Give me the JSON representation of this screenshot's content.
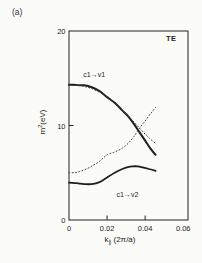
{
  "figure": {
    "panel_label": "(a)",
    "mode_label": "TE",
    "background": "#fbfbf8",
    "ink": "#222222",
    "curve_color": "#1f1f1f",
    "dotted_color": "#3a3a3a"
  },
  "labels": {
    "y": {
      "base": "m",
      "sup": "2",
      "unit": "(eV)",
      "full": "m²(eV)"
    },
    "x": {
      "base": "k",
      "sub": "∥",
      "unit": "(2π/a)",
      "full": "k∥ (2π/a)"
    }
  },
  "chart_data": {
    "type": "line",
    "title": "",
    "xlabel": "k∥ (2π/a)",
    "ylabel": "m² (eV)",
    "xlim": [
      0,
      0.0625
    ],
    "ylim": [
      0,
      20
    ],
    "grid": false,
    "legend": "none (inline curve labels)",
    "x_ticks": [
      {
        "v": 0,
        "label": "0",
        "mark": false
      },
      {
        "v": 0.02,
        "label": "0.02",
        "mark": true
      },
      {
        "v": 0.04,
        "label": "0.04",
        "mark": true
      },
      {
        "v": 0.06,
        "label": "0.06",
        "mark": false
      }
    ],
    "y_ticks": [
      {
        "v": 0,
        "label": "0",
        "mark": false
      },
      {
        "v": 10,
        "label": "10",
        "mark": true
      },
      {
        "v": 20,
        "label": "20",
        "mark": false
      }
    ],
    "series": [
      {
        "id": "c1-v1-solid",
        "name": "c1→v1 (solid)",
        "line": "solid",
        "width": 2.0,
        "points": [
          [
            0,
            14.3
          ],
          [
            0.004,
            14.3
          ],
          [
            0.008,
            14.25
          ],
          [
            0.012,
            14.05
          ],
          [
            0.016,
            13.65
          ],
          [
            0.02,
            13.0
          ],
          [
            0.024,
            12.4
          ],
          [
            0.028,
            11.6
          ],
          [
            0.031,
            11.0
          ],
          [
            0.034,
            10.2
          ],
          [
            0.037,
            9.3
          ],
          [
            0.04,
            8.4
          ],
          [
            0.043,
            7.5
          ],
          [
            0.0455,
            6.9
          ]
        ]
      },
      {
        "id": "c1-v1-dotted",
        "name": "c1→v1 (dotted)",
        "line": "dotted",
        "width": 1.0,
        "points": [
          [
            0,
            14.25
          ],
          [
            0.006,
            14.2
          ],
          [
            0.012,
            13.9
          ],
          [
            0.018,
            13.3
          ],
          [
            0.023,
            12.5
          ],
          [
            0.028,
            11.6
          ],
          [
            0.033,
            10.6
          ],
          [
            0.038,
            9.5
          ],
          [
            0.042,
            8.7
          ],
          [
            0.0455,
            8.1
          ]
        ]
      },
      {
        "id": "ascending-dotted",
        "name": "ascending dotted branch",
        "line": "dotted",
        "width": 1.0,
        "points": [
          [
            0,
            5.0
          ],
          [
            0.004,
            5.05
          ],
          [
            0.008,
            5.3
          ],
          [
            0.012,
            5.7
          ],
          [
            0.016,
            6.2
          ],
          [
            0.02,
            6.9
          ],
          [
            0.024,
            7.2
          ],
          [
            0.028,
            7.6
          ],
          [
            0.031,
            8.1
          ],
          [
            0.034,
            8.8
          ],
          [
            0.037,
            9.7
          ],
          [
            0.04,
            10.5
          ],
          [
            0.043,
            11.3
          ],
          [
            0.0455,
            11.9
          ]
        ]
      },
      {
        "id": "c1-v2-solid",
        "name": "c1→v2 (solid)",
        "line": "solid",
        "width": 1.8,
        "points": [
          [
            0,
            3.95
          ],
          [
            0.004,
            3.9
          ],
          [
            0.008,
            3.8
          ],
          [
            0.012,
            3.8
          ],
          [
            0.016,
            4.0
          ],
          [
            0.02,
            4.5
          ],
          [
            0.024,
            5.0
          ],
          [
            0.028,
            5.4
          ],
          [
            0.032,
            5.65
          ],
          [
            0.035,
            5.7
          ],
          [
            0.038,
            5.6
          ],
          [
            0.042,
            5.4
          ],
          [
            0.0455,
            5.2
          ]
        ]
      }
    ],
    "annotations": [
      {
        "text": "c1→v1",
        "k": 0.0075,
        "v": 15.1
      },
      {
        "text": "c1→v2",
        "k": 0.025,
        "v": 2.4
      }
    ]
  }
}
